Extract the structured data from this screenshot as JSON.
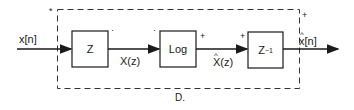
{
  "diagram": {
    "system_label": "D.",
    "input_signal": "x[n]",
    "output_signal": "x[n]",
    "output_signal_hat": true,
    "blocks": [
      {
        "id": "z-transform",
        "label": "Z"
      },
      {
        "id": "log",
        "label": "Log"
      },
      {
        "id": "inverse-z",
        "label": "Z",
        "superscript": "−1"
      }
    ],
    "edges": [
      {
        "from": "input",
        "to": "z-transform",
        "label": "x[n]"
      },
      {
        "from": "z-transform",
        "to": "log",
        "label": "X(z)"
      },
      {
        "from": "log",
        "to": "inverse-z",
        "label": "X(z)",
        "hat": true
      },
      {
        "from": "inverse-z",
        "to": "output",
        "label": "x[n]",
        "hat": true
      }
    ],
    "marks": {
      "input_corner": "*",
      "z_out": "·",
      "log_in": "·",
      "log_out": "+",
      "invz_in": "+",
      "output_corner": "+"
    },
    "colors": {
      "line": "#1a1a1a",
      "background": "#ffffff"
    }
  }
}
